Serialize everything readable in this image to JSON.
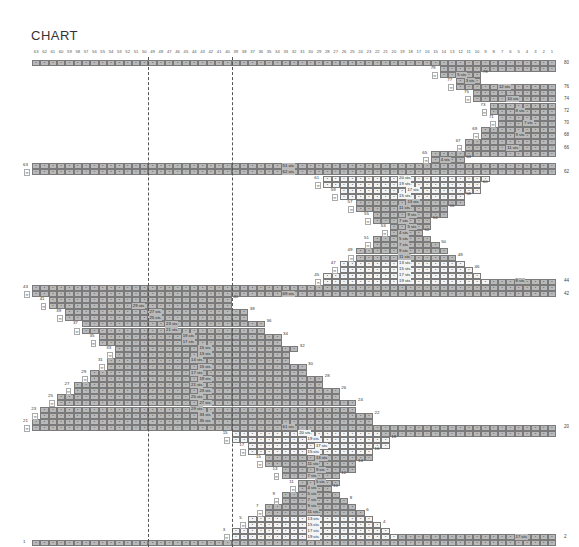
{
  "title": "CHART",
  "grid": {
    "columns": 63,
    "x0": 32,
    "cell_w": 8.32,
    "y_row80": 60,
    "row_step": 6.08,
    "cell_h": 6,
    "dashed_lines_after_columns": [
      50,
      40
    ],
    "colors": {
      "dark": "#b9b9b9",
      "light": "#f4f4f4",
      "border": "#7a7a7a"
    }
  },
  "column_numbers": [
    63,
    62,
    61,
    60,
    59,
    58,
    57,
    56,
    55,
    54,
    53,
    52,
    51,
    50,
    49,
    48,
    47,
    46,
    45,
    44,
    43,
    42,
    41,
    40,
    39,
    38,
    37,
    36,
    35,
    34,
    33,
    32,
    31,
    30,
    29,
    28,
    27,
    26,
    25,
    24,
    23,
    22,
    21,
    20,
    19,
    18,
    17,
    16,
    15,
    14,
    13,
    12,
    11,
    10,
    9,
    8,
    7,
    6,
    5,
    4,
    3,
    2,
    1
  ],
  "right_row_labels": [
    "80",
    "76",
    "74",
    "72",
    "70",
    "68",
    "66",
    "62",
    "44",
    "42",
    "20",
    "2"
  ],
  "chart_data": {
    "type": "table",
    "title": "CHART",
    "xlabel": "stitch columns 63 → 1",
    "ylabel": "rows 1 → 80",
    "rows": [
      {
        "row": 80,
        "segs": [
          [
            63,
            1,
            "d"
          ]
        ]
      },
      {
        "row": 79,
        "segs": [
          [
            14,
            1,
            "d"
          ]
        ],
        "num": "79"
      },
      {
        "row": 78,
        "segs": [
          [
            14,
            10,
            "d"
          ]
        ],
        "mark": "∞",
        "label": "5 sts",
        "rnum": "78"
      },
      {
        "row": 77,
        "segs": [
          [
            12,
            10,
            "d"
          ]
        ],
        "num": "77",
        "label": "3 sts"
      },
      {
        "row": 76,
        "segs": [
          [
            12,
            1,
            "d"
          ]
        ],
        "mark": "∞",
        "label": "12 sts"
      },
      {
        "row": 75,
        "segs": [
          [
            10,
            1,
            "d"
          ]
        ],
        "num": "75"
      },
      {
        "row": 74,
        "segs": [
          [
            10,
            1,
            "d"
          ]
        ],
        "mark": "∞",
        "label": "10 sts"
      },
      {
        "row": 73,
        "segs": [
          [
            8,
            1,
            "d"
          ]
        ],
        "num": "73"
      },
      {
        "row": 72,
        "segs": [
          [
            8,
            1,
            "d"
          ]
        ],
        "mark": "∞",
        "label": "8 sts"
      },
      {
        "row": 71,
        "segs": [
          [
            7,
            1,
            "d"
          ]
        ],
        "num": "71"
      },
      {
        "row": 70,
        "segs": [
          [
            7,
            1,
            "d"
          ]
        ],
        "mark": "∞",
        "label": "7 sts"
      },
      {
        "row": 69,
        "segs": [
          [
            9,
            1,
            "d"
          ]
        ],
        "num": "69"
      },
      {
        "row": 68,
        "segs": [
          [
            9,
            1,
            "d"
          ]
        ],
        "mark": "∞",
        "label": "9 sts"
      },
      {
        "row": 67,
        "segs": [
          [
            11,
            1,
            "d"
          ]
        ],
        "num": "67"
      },
      {
        "row": 66,
        "segs": [
          [
            11,
            1,
            "d"
          ]
        ],
        "mark": "∞",
        "label": "11 sts"
      },
      {
        "row": 65,
        "segs": [
          [
            15,
            1,
            "d"
          ]
        ],
        "num": "65"
      },
      {
        "row": 64,
        "segs": [
          [
            15,
            12,
            "d"
          ]
        ],
        "mark": "∞",
        "label": "4 sts",
        "rnum": "64"
      },
      {
        "row": 63,
        "segs": [
          [
            63,
            1,
            "d"
          ]
        ],
        "num": "63",
        "label": "51 sts"
      },
      {
        "row": 62,
        "segs": [
          [
            63,
            1,
            "d"
          ]
        ],
        "mark": "∞",
        "label": "62 sts"
      },
      {
        "row": 61,
        "segs": [
          [
            28,
            9,
            "l"
          ]
        ],
        "num": "61",
        "label": "20 sts"
      },
      {
        "row": 60,
        "segs": [
          [
            28,
            10,
            "l"
          ]
        ],
        "mark": "∞",
        "label": "19 sts",
        "rnum": "60"
      },
      {
        "row": 59,
        "segs": [
          [
            26,
            10,
            "l"
          ]
        ],
        "num": "59",
        "label": "17 sts"
      },
      {
        "row": 58,
        "segs": [
          [
            26,
            12,
            "l"
          ]
        ],
        "mark": "∞",
        "label": "15 sts",
        "rnum": "58"
      },
      {
        "row": 57,
        "segs": [
          [
            24,
            12,
            "d"
          ]
        ],
        "num": "57",
        "label": "13 sts"
      },
      {
        "row": 56,
        "segs": [
          [
            24,
            14,
            "d"
          ]
        ],
        "mark": "∞",
        "label": "11 sts",
        "rnum": "56"
      },
      {
        "row": 55,
        "segs": [
          [
            22,
            14,
            "d"
          ]
        ],
        "num": "55",
        "label": "9 sts"
      },
      {
        "row": 54,
        "segs": [
          [
            22,
            16,
            "d"
          ]
        ],
        "mark": "∞",
        "label": "7 sts",
        "rnum": "54"
      },
      {
        "row": 53,
        "segs": [
          [
            20,
            16,
            "d"
          ]
        ],
        "num": "53",
        "label": "5 sts"
      },
      {
        "row": 52,
        "segs": [
          [
            20,
            17,
            "d"
          ]
        ],
        "mark": "∞",
        "label": "4 sts",
        "rnum": "52"
      },
      {
        "row": 51,
        "segs": [
          [
            22,
            16,
            "d"
          ]
        ],
        "num": "51",
        "label": "5 sts"
      },
      {
        "row": 50,
        "segs": [
          [
            22,
            15,
            "d"
          ]
        ],
        "mark": "∞",
        "label": "7 sts",
        "rnum": "50"
      },
      {
        "row": 49,
        "segs": [
          [
            24,
            14,
            "d"
          ]
        ],
        "num": "49",
        "label": "9 sts"
      },
      {
        "row": 48,
        "segs": [
          [
            24,
            13,
            "d"
          ]
        ],
        "mark": "∞",
        "label": "11 sts",
        "rnum": "48"
      },
      {
        "row": 47,
        "segs": [
          [
            26,
            12,
            "l"
          ]
        ],
        "num": "47",
        "label": "13 sts"
      },
      {
        "row": 46,
        "segs": [
          [
            26,
            11,
            "l"
          ]
        ],
        "mark": "∞",
        "label": "15 sts",
        "rnum": "46"
      },
      {
        "row": 45,
        "segs": [
          [
            28,
            10,
            "l"
          ]
        ],
        "num": "45",
        "label": "17 sts"
      },
      {
        "row": 44,
        "segs": [
          [
            28,
            9,
            "l"
          ],
          [
            8,
            1,
            "d"
          ]
        ],
        "mark": "∞",
        "label": "19 sts",
        "label2": "8 sts"
      },
      {
        "row": 43,
        "segs": [
          [
            63,
            1,
            "d"
          ]
        ],
        "num": "43"
      },
      {
        "row": 42,
        "segs": [
          [
            63,
            1,
            "d"
          ]
        ],
        "mark": "∞",
        "label": "69 sts"
      },
      {
        "row": 41,
        "segs": [
          [
            61,
            40,
            "d"
          ]
        ],
        "num": "41",
        "rnum": "40"
      },
      {
        "row": 40,
        "segs": [
          [
            61,
            40,
            "d"
          ]
        ],
        "mark": "∞",
        "label": "29 sts"
      },
      {
        "row": 39,
        "segs": [
          [
            59,
            38,
            "d"
          ]
        ],
        "num": "39",
        "label": "27 sts",
        "rnum": "38"
      },
      {
        "row": 38,
        "segs": [
          [
            59,
            38,
            "d"
          ]
        ],
        "mark": "∞",
        "label": "25 sts"
      },
      {
        "row": 37,
        "segs": [
          [
            57,
            36,
            "d"
          ]
        ],
        "num": "37",
        "label": "23 sts",
        "rnum": "36"
      },
      {
        "row": 36,
        "segs": [
          [
            57,
            36,
            "d"
          ]
        ],
        "mark": "∞",
        "label": "21 sts"
      },
      {
        "row": 35,
        "segs": [
          [
            55,
            34,
            "d"
          ]
        ],
        "num": "35",
        "label": "19 sts",
        "rnum": "34"
      },
      {
        "row": 34,
        "segs": [
          [
            55,
            34,
            "d"
          ]
        ],
        "mark": "∞",
        "label": "17 sts"
      },
      {
        "row": 33,
        "segs": [
          [
            53,
            32,
            "d"
          ]
        ],
        "num": "33",
        "label": "15 sts",
        "rnum": "32"
      },
      {
        "row": 32,
        "segs": [
          [
            53,
            33,
            "d"
          ]
        ],
        "mark": "∞",
        "label": "13 sts"
      },
      {
        "row": 31,
        "segs": [
          [
            54,
            33,
            "d"
          ]
        ],
        "num": "31",
        "label": "14 sts"
      },
      {
        "row": 30,
        "segs": [
          [
            54,
            31,
            "d"
          ]
        ],
        "mark": "∞",
        "label": "15 sts",
        "rnum": "30"
      },
      {
        "row": 29,
        "segs": [
          [
            56,
            31,
            "d"
          ]
        ],
        "num": "29",
        "label": "17 sts"
      },
      {
        "row": 28,
        "segs": [
          [
            56,
            29,
            "d"
          ]
        ],
        "mark": "∞",
        "label": "19 sts",
        "rnum": "28"
      },
      {
        "row": 27,
        "segs": [
          [
            58,
            29,
            "d"
          ]
        ],
        "num": "27",
        "label": "21 sts"
      },
      {
        "row": 26,
        "segs": [
          [
            58,
            27,
            "d"
          ]
        ],
        "mark": "∞",
        "label": "23 sts",
        "rnum": "26"
      },
      {
        "row": 25,
        "segs": [
          [
            60,
            27,
            "d"
          ]
        ],
        "num": "25",
        "label": "25 sts"
      },
      {
        "row": 24,
        "segs": [
          [
            60,
            25,
            "d"
          ]
        ],
        "mark": "∞",
        "label": "27 sts",
        "rnum": "24"
      },
      {
        "row": 23,
        "segs": [
          [
            62,
            25,
            "d"
          ]
        ],
        "num": "23",
        "label": "29 sts"
      },
      {
        "row": 22,
        "segs": [
          [
            62,
            23,
            "d"
          ]
        ],
        "mark": "∞",
        "label": "33 sts",
        "rnum": "22"
      },
      {
        "row": 21,
        "segs": [
          [
            63,
            23,
            "d"
          ]
        ],
        "num": "21",
        "label": "35 sts"
      },
      {
        "row": 20,
        "segs": [
          [
            63,
            1,
            "d"
          ]
        ],
        "mark": "∞",
        "label": "61 sts"
      },
      {
        "row": 19,
        "segs": [
          [
            39,
            22,
            "l"
          ],
          [
            21,
            1,
            "d"
          ]
        ],
        "num": "15",
        "label": "20 sts"
      },
      {
        "row": 18,
        "segs": [
          [
            39,
            21,
            "l"
          ]
        ],
        "mark": "∞",
        "label": "19 sts",
        "rnum": "18"
      },
      {
        "row": 17,
        "segs": [
          [
            37,
            21,
            "l"
          ]
        ],
        "num": "17",
        "label": "17 sts"
      },
      {
        "row": 16,
        "segs": [
          [
            37,
            23,
            "l"
          ]
        ],
        "mark": "∞",
        "label": "15 sts",
        "rnum": "16"
      },
      {
        "row": 15,
        "segs": [
          [
            35,
            23,
            "d"
          ]
        ],
        "num": "15",
        "label": "13 sts"
      },
      {
        "row": 14,
        "segs": [
          [
            35,
            25,
            "d"
          ]
        ],
        "mark": "∞",
        "label": "11 sts",
        "rnum": "14"
      },
      {
        "row": 13,
        "segs": [
          [
            33,
            25,
            "d"
          ]
        ],
        "num": "13",
        "label": "9 sts"
      },
      {
        "row": 12,
        "segs": [
          [
            33,
            27,
            "d"
          ]
        ],
        "mark": "∞",
        "label": "7 sts",
        "rnum": "12"
      },
      {
        "row": 11,
        "segs": [
          [
            31,
            27,
            "d"
          ]
        ],
        "num": "11",
        "label": "5 sts"
      },
      {
        "row": 10,
        "segs": [
          [
            31,
            28,
            "d"
          ]
        ],
        "mark": "∞",
        "label": "4 sts",
        "rnum": "10"
      },
      {
        "row": 9,
        "segs": [
          [
            33,
            27,
            "d"
          ]
        ],
        "num": "9",
        "label": "5 sts"
      },
      {
        "row": 8,
        "segs": [
          [
            33,
            26,
            "d"
          ]
        ],
        "mark": "∞",
        "label": "7 sts",
        "rnum": "8"
      },
      {
        "row": 7,
        "segs": [
          [
            35,
            25,
            "d"
          ]
        ],
        "num": "7",
        "label": "9 sts"
      },
      {
        "row": 6,
        "segs": [
          [
            35,
            24,
            "d"
          ]
        ],
        "mark": "∞",
        "label": "11 sts",
        "rnum": "6"
      },
      {
        "row": 5,
        "segs": [
          [
            37,
            23,
            "l"
          ]
        ],
        "num": "5",
        "label": "13 sts"
      },
      {
        "row": 4,
        "segs": [
          [
            37,
            22,
            "l"
          ]
        ],
        "mark": "∞",
        "label": "15 sts",
        "rnum": "4"
      },
      {
        "row": 3,
        "segs": [
          [
            39,
            21,
            "l"
          ]
        ],
        "num": "3",
        "label": "17 sts"
      },
      {
        "row": 2,
        "segs": [
          [
            39,
            20,
            "l"
          ],
          [
            19,
            1,
            "d"
          ]
        ],
        "mark": "∞",
        "label": "19 sts",
        "label2": "17 sts"
      },
      {
        "row": 1,
        "segs": [
          [
            63,
            1,
            "d"
          ]
        ],
        "num": "1"
      }
    ]
  }
}
